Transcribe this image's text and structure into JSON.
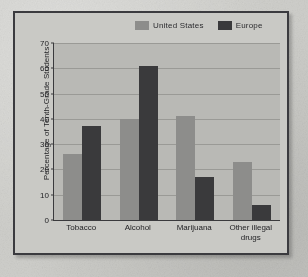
{
  "chart_data": {
    "type": "bar",
    "title": "",
    "xlabel": "",
    "ylabel": "Percentage of Tenth-Grade Students",
    "ylim": [
      0,
      70
    ],
    "ytick_step": 10,
    "yticks": [
      70,
      60,
      50,
      40,
      30,
      20,
      10,
      0
    ],
    "grid": true,
    "legend_position": "top-right",
    "categories": [
      "Tobacco",
      "Alcohol",
      "Marijuana",
      "Other illegal drugs"
    ],
    "category_lines": [
      [
        "Tobacco"
      ],
      [
        "Alcohol"
      ],
      [
        "Marijuana"
      ],
      [
        "Other illegal",
        "drugs"
      ]
    ],
    "series": [
      {
        "name": "United States",
        "color": "#8d8d8b",
        "values": [
          26,
          40,
          41,
          23
        ]
      },
      {
        "name": "Europe",
        "color": "#3a3a3c",
        "values": [
          37,
          61,
          17,
          6
        ]
      }
    ]
  },
  "legend": {
    "entries": [
      {
        "label": "United States",
        "swatch": "legend-swatch-united-states"
      },
      {
        "label": "Europe",
        "swatch": "legend-swatch-europe"
      }
    ]
  },
  "colors": {
    "series_us": "#8d8d8b",
    "series_eu": "#3a3a3c",
    "plot_background": "#b9b9b5",
    "figure_background": "#c9c9c5",
    "frame": "#3b3b3f",
    "gridline": "#9a9a96",
    "text": "#232326"
  }
}
